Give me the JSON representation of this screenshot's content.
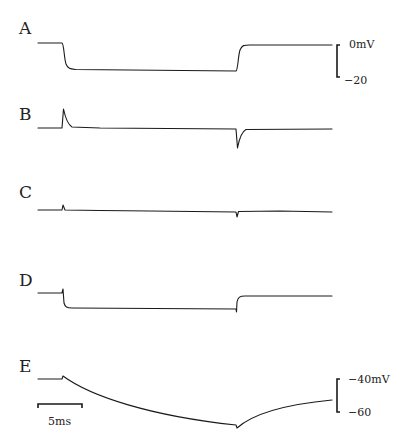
{
  "figure": {
    "panels": [
      {
        "label": "A",
        "description": "voltage step trace"
      },
      {
        "label": "B",
        "description": "capacitive transient trace"
      },
      {
        "label": "C",
        "description": "residual transient trace"
      },
      {
        "label": "D",
        "description": "voltage step trace with small transients"
      },
      {
        "label": "E",
        "description": "slow exponential response trace"
      }
    ],
    "voltage_scale_top": {
      "upper": "0mV",
      "lower": "−20"
    },
    "voltage_scale_bottom": {
      "upper": "−40mV",
      "lower": "−60"
    },
    "time_scale": {
      "label": "5ms"
    }
  }
}
